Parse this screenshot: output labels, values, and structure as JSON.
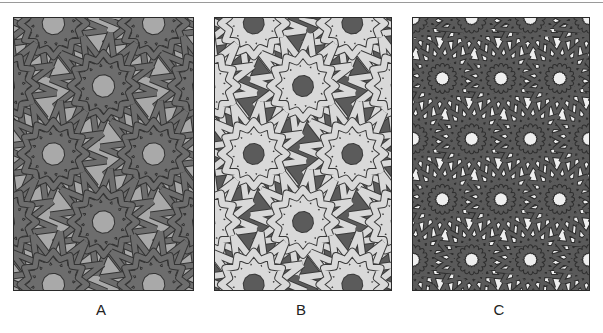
{
  "figure": {
    "panels": [
      {
        "id": "a",
        "label": "A",
        "background_color": "#a9a9a9",
        "band_fill_color": "#6d6d6d",
        "band_outline_color": "#333333",
        "description": "Interlaced 12-fold rosette pattern, dark bands on medium gray ground"
      },
      {
        "id": "b",
        "label": "B",
        "background_color": "#5b5b5b",
        "band_fill_color": "#d9d9d9",
        "band_outline_color": "#3a3a3a",
        "description": "Interlaced 12-fold rosette pattern, light bands on dark gray ground"
      },
      {
        "id": "c",
        "label": "C",
        "background_color": "#efefef",
        "band_fill_color": "#5a5a5a",
        "band_outline_color": "#2e2e2e",
        "description": "Dense interlaced star pattern, dark bands on near-white ground"
      }
    ]
  }
}
